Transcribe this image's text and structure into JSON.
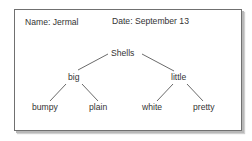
{
  "header": {
    "name_label": "Name: Jermal",
    "date_label": "Date: September 13"
  },
  "tree": {
    "root": "Shells",
    "children": [
      {
        "label": "big",
        "children": [
          "bumpy",
          "plain"
        ]
      },
      {
        "label": "little",
        "children": [
          "white",
          "pretty"
        ]
      }
    ]
  }
}
